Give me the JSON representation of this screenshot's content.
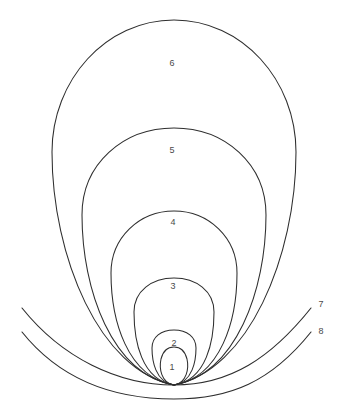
{
  "figure": {
    "background_color": "#ffffff",
    "stroke_color": "#2e2e2e",
    "label_color": "#4a4a4a",
    "width": 344,
    "height": 420,
    "clipped_header_text": "",
    "convergence_point": {
      "x": 174,
      "y": 385
    },
    "closed_curves": [
      {
        "label": "1",
        "label_x": 172,
        "label_y": 368,
        "apex_y": 348,
        "half_width": 13,
        "widest_y": 367,
        "path": "M 174 385 C 161 383 159 368 161 359 C 163 351 168 347 174 347 C 180 347 185 351 187 359 C 189 368 187 383 174 385 Z"
      },
      {
        "label": "2",
        "label_x": 174,
        "label_y": 344,
        "apex_y": 330,
        "half_width": 22,
        "widest_y": 355,
        "path": "M 174 385 C 155 382 152 360 152 348 C 152 337 161 330 174 330 C 187 330 196 337 196 348 C 196 360 193 382 174 385 Z"
      },
      {
        "label": "3",
        "label_x": 173,
        "label_y": 287,
        "apex_y": 278,
        "half_width": 40,
        "widest_y": 320,
        "path": "M 174 385 C 141 380 134 340 134 312 C 134 291 152 278 174 278 C 196 278 214 291 214 312 C 214 340 207 380 174 385 Z"
      },
      {
        "label": "4",
        "label_x": 173,
        "label_y": 223,
        "apex_y": 211,
        "half_width": 63,
        "widest_y": 292,
        "path": "M 174 385 C 127 377 111 320 111 273 C 111 238 139 211 174 211 C 209 211 237 238 237 273 C 237 320 221 377 174 385 Z"
      },
      {
        "label": "5",
        "label_x": 172,
        "label_y": 151,
        "apex_y": 128,
        "half_width": 92,
        "widest_y": 250,
        "path": "M 174 385 C 112 374 82 290 82 215 C 82 164 123 128 174 128 C 225 128 266 164 266 215 C 266 290 236 374 174 385 Z"
      },
      {
        "label": "6",
        "label_x": 172,
        "label_y": 64,
        "apex_y": 20,
        "half_width": 122,
        "widest_y": 178,
        "path": "M 174 385 C 100 371 52 257 52 152 C 52 80 106 20 174 20 C 242 20 296 80 296 152 C 296 257 248 371 174 385 Z"
      }
    ],
    "open_curves": [
      {
        "label": "7",
        "label_x": 321,
        "label_y": 305,
        "left_end": {
          "x": 22,
          "y": 308
        },
        "right_end": {
          "x": 311,
          "y": 308
        },
        "lowest_y": 385,
        "path": "M 22 308 C 62 358 118 385 174 385 C 230 385 271 358 311 308"
      },
      {
        "label": "8",
        "label_x": 321,
        "label_y": 332,
        "left_end": {
          "x": 22,
          "y": 332
        },
        "right_end": {
          "x": 311,
          "y": 332
        },
        "lowest_y": 399,
        "path": "M 22 332 C 62 382 118 399 174 399 C 230 399 271 382 311 332"
      }
    ]
  }
}
